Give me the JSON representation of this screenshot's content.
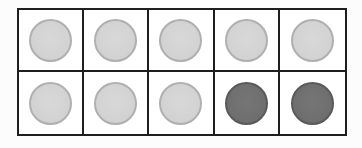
{
  "ten_frame": {
    "rows": 2,
    "columns": 5,
    "colors": {
      "grid_line": "#1e1e1e",
      "light_counter": "#d4d4d4",
      "light_counter_rim": "#b0b0b0",
      "dark_counter": "#707070",
      "dark_counter_rim": "#5a5a5a"
    },
    "cells": [
      {
        "row": 1,
        "col": 1,
        "counter": "light"
      },
      {
        "row": 1,
        "col": 2,
        "counter": "light"
      },
      {
        "row": 1,
        "col": 3,
        "counter": "light"
      },
      {
        "row": 1,
        "col": 4,
        "counter": "light"
      },
      {
        "row": 1,
        "col": 5,
        "counter": "light"
      },
      {
        "row": 2,
        "col": 1,
        "counter": "light"
      },
      {
        "row": 2,
        "col": 2,
        "counter": "light"
      },
      {
        "row": 2,
        "col": 3,
        "counter": "light"
      },
      {
        "row": 2,
        "col": 4,
        "counter": "dark"
      },
      {
        "row": 2,
        "col": 5,
        "counter": "dark"
      }
    ],
    "summary": {
      "light_count": 8,
      "dark_count": 2,
      "total": 10
    }
  }
}
